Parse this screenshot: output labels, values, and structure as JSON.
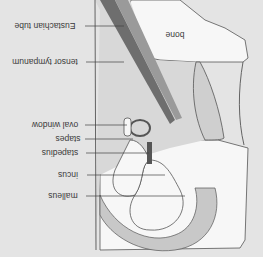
{
  "diagram": {
    "orientation": "rotated 180 degrees",
    "background_color": "#e4e4e4",
    "labels": {
      "bone": "bone",
      "eustachian_tube": "Eustachian tube",
      "tensor_tympanum": "tensor tympanum",
      "oval_window": "oval window",
      "stapes": "stapes",
      "stapedius": "stapedius",
      "incus": "incus",
      "malleus": "malleus"
    },
    "colors": {
      "bone_fill": "#f7f7f7",
      "tissue_fill": "#c8c8c8",
      "muscle_dark": "#6e6e6e",
      "outline": "#555555"
    }
  }
}
